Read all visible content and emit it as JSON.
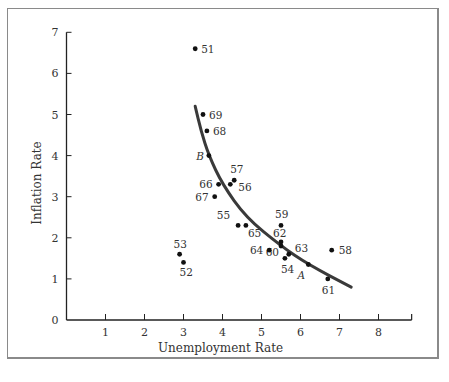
{
  "chart_data": {
    "type": "scatter",
    "title": "",
    "xlabel": "Unemployment Rate",
    "ylabel": "Inflation Rate",
    "xlim": [
      0,
      9
    ],
    "ylim": [
      0,
      7
    ],
    "x_ticks": [
      "1",
      "2",
      "3",
      "4",
      "5",
      "6",
      "7",
      "8"
    ],
    "y_ticks": [
      "0",
      "1",
      "2",
      "3",
      "4",
      "5",
      "6",
      "7"
    ],
    "grid": false,
    "legend": null,
    "series": [
      {
        "name": "Annual observations (year labels)",
        "points": [
          {
            "label": "51",
            "x": 3.3,
            "y": 6.6
          },
          {
            "label": "52",
            "x": 3.0,
            "y": 1.4
          },
          {
            "label": "53",
            "x": 2.9,
            "y": 1.6
          },
          {
            "label": "54",
            "x": 5.6,
            "y": 1.5
          },
          {
            "label": "55",
            "x": 4.4,
            "y": 2.3
          },
          {
            "label": "56",
            "x": 4.2,
            "y": 3.3
          },
          {
            "label": "57",
            "x": 4.3,
            "y": 3.4
          },
          {
            "label": "58",
            "x": 6.8,
            "y": 1.7
          },
          {
            "label": "59",
            "x": 5.5,
            "y": 2.3
          },
          {
            "label": "60",
            "x": 5.5,
            "y": 1.8
          },
          {
            "label": "61",
            "x": 6.7,
            "y": 1.0
          },
          {
            "label": "62",
            "x": 5.5,
            "y": 1.9
          },
          {
            "label": "63",
            "x": 5.7,
            "y": 1.6
          },
          {
            "label": "64",
            "x": 5.2,
            "y": 1.7
          },
          {
            "label": "65",
            "x": 4.6,
            "y": 2.3
          },
          {
            "label": "66",
            "x": 3.9,
            "y": 3.3
          },
          {
            "label": "67",
            "x": 3.8,
            "y": 3.0
          },
          {
            "label": "68",
            "x": 3.6,
            "y": 4.6
          },
          {
            "label": "69",
            "x": 3.5,
            "y": 5.0
          }
        ]
      },
      {
        "name": "Phillips curve (fitted)",
        "type": "line",
        "points": [
          {
            "x": 3.3,
            "y": 5.2
          },
          {
            "x": 3.45,
            "y": 4.6
          },
          {
            "x": 3.65,
            "y": 4.0
          },
          {
            "x": 4.0,
            "y": 3.3
          },
          {
            "x": 4.6,
            "y": 2.5
          },
          {
            "x": 5.5,
            "y": 1.8
          },
          {
            "x": 6.2,
            "y": 1.35
          },
          {
            "x": 7.3,
            "y": 0.8
          }
        ]
      }
    ],
    "annotations": [
      {
        "text": "A",
        "x": 6.2,
        "y": 1.35
      },
      {
        "text": "B",
        "x": 3.65,
        "y": 4.0
      }
    ]
  },
  "labels": {
    "xlabel": "Unemployment Rate",
    "ylabel": "Inflation Rate",
    "point_A": "A",
    "point_B": "B"
  },
  "colors": {
    "curve": "#3a3a3a",
    "points": "#111111",
    "axis": "#222222",
    "text": "#333333"
  }
}
